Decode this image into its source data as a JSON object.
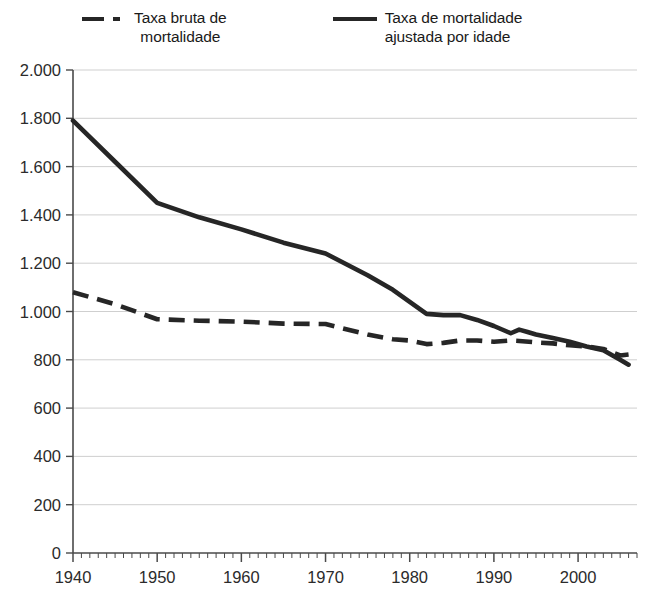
{
  "legend": {
    "position": "top",
    "items": [
      {
        "label": "Taxa bruta de\nmortalidade",
        "style": "dashed",
        "icon": "dashed-line-swatch-icon"
      },
      {
        "label": "Taxa de mortalidade\najustada por idade",
        "style": "solid",
        "icon": "solid-line-swatch-icon"
      }
    ]
  },
  "chart_data": {
    "type": "line",
    "title": "",
    "subtitle": "",
    "xlabel": "",
    "ylabel": "",
    "xlim": [
      1940,
      2007
    ],
    "ylim": [
      0,
      2000
    ],
    "grid": true,
    "grid_axis": "y",
    "legend_position": "top",
    "x_ticks_major": [
      1940,
      1950,
      1960,
      1970,
      1980,
      1990,
      2000
    ],
    "x_tick_labels": [
      "1940",
      "1950",
      "1960",
      "1970",
      "1980",
      "1990",
      "2000"
    ],
    "x_minor_tick_step": 1,
    "y_ticks": [
      0,
      200,
      400,
      600,
      800,
      1000,
      1200,
      1400,
      1600,
      1800,
      2000
    ],
    "y_tick_labels": [
      "0",
      "200",
      "400",
      "600",
      "800",
      "1.000",
      "1.200",
      "1.400",
      "1.600",
      "1.800",
      "2.000"
    ],
    "decimal_separator_note": "period used as thousands separator",
    "series": [
      {
        "name": "Taxa bruta de mortalidade",
        "style": "dashed",
        "color": "#262626",
        "x": [
          1940,
          1945,
          1950,
          1955,
          1960,
          1965,
          1970,
          1975,
          1978,
          1980,
          1982,
          1984,
          1986,
          1988,
          1990,
          1992,
          1993,
          1995,
          1997,
          1999,
          2001,
          2003,
          2005,
          2006
        ],
        "values": [
          1080,
          1030,
          968,
          962,
          958,
          950,
          948,
          905,
          885,
          880,
          865,
          870,
          880,
          880,
          875,
          880,
          878,
          872,
          868,
          860,
          855,
          845,
          818,
          822
        ]
      },
      {
        "name": "Taxa de mortalidade ajustada por idade",
        "style": "solid",
        "color": "#262626",
        "x": [
          1940,
          1945,
          1950,
          1955,
          1960,
          1965,
          1970,
          1975,
          1978,
          1980,
          1982,
          1984,
          1986,
          1988,
          1990,
          1992,
          1993,
          1994,
          1995,
          1997,
          1999,
          2001,
          2003,
          2005,
          2006
        ],
        "values": [
          1790,
          1620,
          1450,
          1390,
          1340,
          1285,
          1240,
          1150,
          1090,
          1040,
          990,
          985,
          985,
          965,
          940,
          910,
          925,
          915,
          905,
          890,
          875,
          855,
          840,
          800,
          780
        ]
      }
    ]
  }
}
